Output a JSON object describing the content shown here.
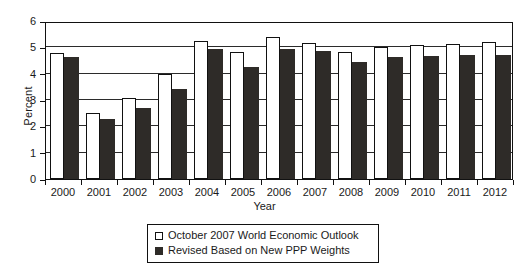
{
  "chart_data": {
    "type": "bar",
    "title": "",
    "xlabel": "Year",
    "ylabel": "Percent",
    "ylim": [
      0,
      6
    ],
    "yticks": [
      0,
      1,
      2,
      3,
      4,
      5,
      6
    ],
    "grid": true,
    "legend_position": "bottom-center",
    "categories": [
      "2000",
      "2001",
      "2002",
      "2003",
      "2004",
      "2005",
      "2006",
      "2007",
      "2008",
      "2009",
      "2010",
      "2011",
      "2012"
    ],
    "series": [
      {
        "name": "October 2007 World Economic Outlook",
        "color": "#ffffff",
        "values": [
          4.78,
          2.5,
          3.07,
          4.0,
          5.26,
          4.84,
          5.38,
          5.16,
          4.84,
          5.0,
          5.1,
          5.14,
          5.19
        ]
      },
      {
        "name": "Revised Based on New PPP Weights",
        "color": "#2e2b28",
        "values": [
          4.65,
          2.27,
          2.71,
          3.43,
          4.92,
          4.27,
          4.92,
          4.88,
          4.43,
          4.64,
          4.69,
          4.7,
          4.71
        ]
      }
    ]
  },
  "legend": {
    "items": [
      {
        "label": "October 2007 World Economic Outlook",
        "swatch": "light"
      },
      {
        "label": "Revised Based on New PPP Weights",
        "swatch": "dark"
      }
    ]
  }
}
